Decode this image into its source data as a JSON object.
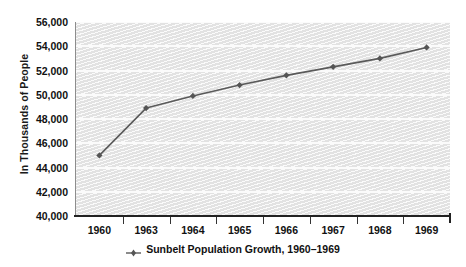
{
  "chart_data": {
    "type": "line",
    "title": "",
    "xlabel": "",
    "ylabel": "In Thousands of People",
    "categories": [
      "1960",
      "1963",
      "1964",
      "1965",
      "1966",
      "1967",
      "1968",
      "1969"
    ],
    "values": [
      45000,
      48900,
      49900,
      50800,
      51600,
      52300,
      53000,
      53900
    ],
    "series": [
      {
        "name": "Sunbelt Population Growth, 1960–1969",
        "values": [
          45000,
          48900,
          49900,
          50800,
          51600,
          52300,
          53000,
          53900
        ]
      }
    ],
    "ylim": [
      40000,
      56000
    ],
    "ytick_step": 2000,
    "ytick_labels": [
      "56,000",
      "54,000",
      "52,000",
      "50,000",
      "48,000",
      "46,000",
      "44,000",
      "42,000",
      "40,000"
    ],
    "ytick_values": [
      56000,
      54000,
      52000,
      50000,
      48000,
      46000,
      44000,
      42000,
      40000
    ],
    "grid": true,
    "grid_orientation": "horizontal",
    "legend_position": "bottom-center",
    "legend": [
      {
        "label": "Sunbelt Population Growth, 1960–1969",
        "marker": "diamond",
        "color": "#5a5a5a"
      }
    ],
    "colors": {
      "line": "#5a5a5a",
      "marker": "#555555",
      "plot_background": "#e2e2e2",
      "gridline": "#fbfbfb",
      "axis": "#222222",
      "text": "#111111"
    }
  }
}
